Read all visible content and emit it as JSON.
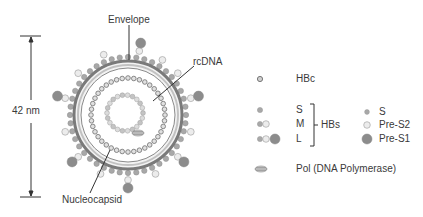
{
  "diagram": {
    "scale_bar": {
      "label": "42 nm"
    },
    "labels": {
      "envelope": "Envelope",
      "rcdna": "rcDNA",
      "nucleocapsid": "Nucleocapsid"
    },
    "colors": {
      "envelope_ring": "#7a7a7a",
      "envelope_inner": "#b5b5b5",
      "s_protein": "#a8a8a8",
      "pres2_protein": "#e8e8e8",
      "pres1_protein": "#8c8c8c",
      "hbc_protein": "#d0d0d0",
      "line": "#333333"
    }
  },
  "legend": {
    "hbc": "HBc",
    "hbs_group": {
      "label": "HBs",
      "items": [
        "S",
        "M",
        "L"
      ]
    },
    "domains": [
      {
        "label": "S"
      },
      {
        "label": "Pre-S2"
      },
      {
        "label": "Pre-S1"
      }
    ],
    "pol": "Pol (DNA Polymerase)"
  }
}
